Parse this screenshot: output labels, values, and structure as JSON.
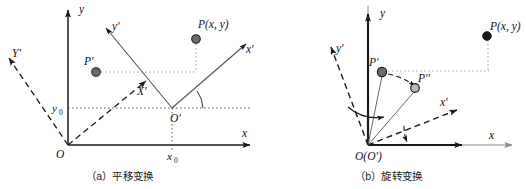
{
  "figure": {
    "panels": [
      {
        "id": "a",
        "caption": "（a）平移变换",
        "axes": {
          "y_label": "y",
          "x_label": "x",
          "yprime_label": "y'",
          "xprime_label": "x'",
          "Yprime_label": "Y'",
          "Xprime_label": "X'"
        },
        "labels": {
          "origin": "O",
          "origin_prime": "O'",
          "point_P": "P(x, y)",
          "point_Pprime": "P'",
          "x0": "x",
          "x0_sub": "0",
          "y0": "y",
          "y0_sub": "0"
        }
      },
      {
        "id": "b",
        "caption": "（b）旋转变换",
        "axes": {
          "y_label": "y",
          "x_label": "x",
          "yprime_label": "y'",
          "xprime_label": "x'"
        },
        "labels": {
          "origin": "O(O')",
          "point_P": "P(x, y)",
          "point_Pprime": "P'",
          "point_Pdprime": "P''"
        }
      }
    ]
  },
  "colors": {
    "axis": "#1a1a1a",
    "axis_light": "#8c8c8c",
    "dashed": "#1a1a1a",
    "dot_fill": "#6b6b6b",
    "dot_stroke": "#1a1a1a",
    "dotted_guide": "#9a9a9a",
    "text": "#121212",
    "background": "#ffffff"
  }
}
